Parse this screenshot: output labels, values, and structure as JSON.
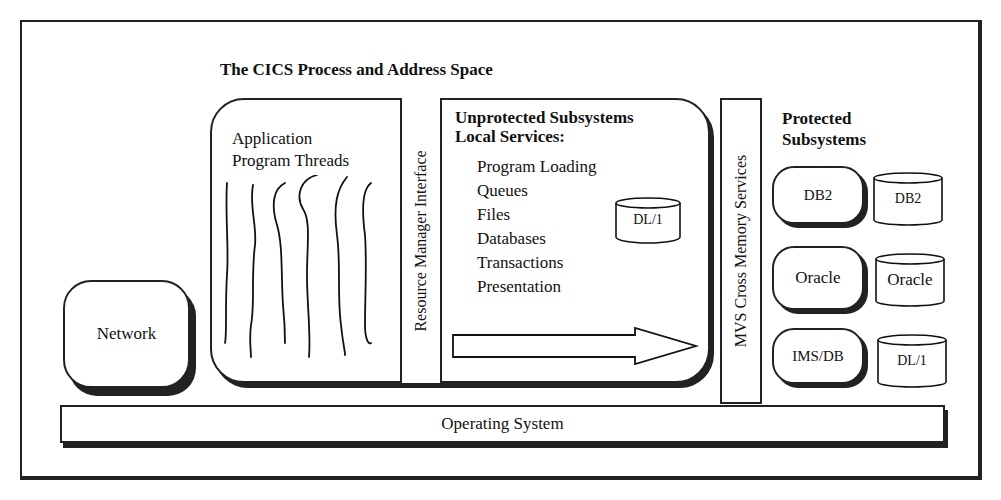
{
  "diagram": {
    "title": "The  CICS Process and Address Space",
    "application_threads": {
      "line1": "Application",
      "line2": "Program Threads"
    },
    "resource_manager_interface": "Resource Manager Interface",
    "unprotected": {
      "heading1": "Unprotected Subsystems",
      "heading2": "Local Services:",
      "services": [
        "Program Loading",
        "Queues",
        "Files",
        "Databases",
        "Transactions",
        "Presentation"
      ],
      "database": "DL/1"
    },
    "mvs_cross_memory": "MVS Cross Memory Services",
    "protected": {
      "heading1": "Protected",
      "heading2": "Subsystems",
      "rows": [
        {
          "subsystem": "DB2",
          "database": "DB2"
        },
        {
          "subsystem": "Oracle",
          "database": "Oracle"
        },
        {
          "subsystem": "IMS/DB",
          "database": "DL/1"
        }
      ]
    },
    "network": "Network",
    "operating_system": "Operating System"
  }
}
